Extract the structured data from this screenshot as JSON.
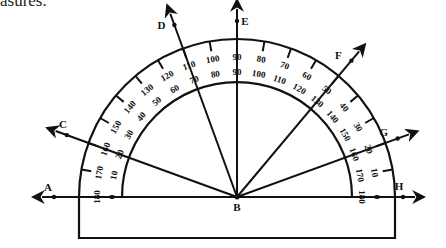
{
  "caption": "asures.",
  "diagram": {
    "type": "protractor",
    "vertex": "B",
    "center": [
      237,
      197
    ],
    "outer_radius": 158,
    "inner_radius": 115,
    "outer_scale": {
      "direction": "0 at right, 180 at left",
      "labels": [
        "0",
        "10",
        "20",
        "30",
        "40",
        "50",
        "60",
        "70",
        "80",
        "90",
        "100",
        "110",
        "120",
        "130",
        "140",
        "150",
        "160",
        "170",
        "180"
      ]
    },
    "inner_scale": {
      "direction": "0 at left, 180 at right",
      "labels": [
        "0",
        "10",
        "20",
        "30",
        "40",
        "50",
        "60",
        "70",
        "80",
        "90",
        "100",
        "110",
        "120",
        "130",
        "140",
        "150",
        "160",
        "170",
        "180"
      ]
    },
    "rays": [
      {
        "label": "A",
        "angle": 180
      },
      {
        "label": "C",
        "angle": 160
      },
      {
        "label": "D",
        "angle": 110
      },
      {
        "label": "E",
        "angle": 90
      },
      {
        "label": "F",
        "angle": 50
      },
      {
        "label": "G",
        "angle": 20
      },
      {
        "label": "H",
        "angle": 0
      }
    ],
    "vertex_label": "B"
  }
}
